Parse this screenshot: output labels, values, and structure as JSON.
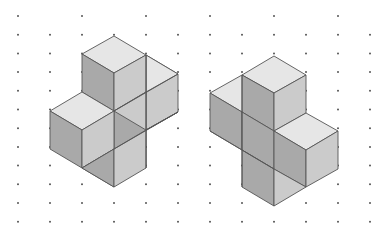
{
  "figure": {
    "colors": {
      "background": "#ffffff",
      "top_face": "#e6e6e6",
      "left_face": "#a9a9a9",
      "right_face": "#cbcbcb",
      "edge": "#555555",
      "dot": "#555555"
    },
    "grid": {
      "dx": 32,
      "dy": 18.7,
      "origin_x": 18,
      "origin_y": 16,
      "cols": 12,
      "rows": 12
    },
    "solids": [
      {
        "name": "left-solid",
        "faces": [
          {
            "type": "right",
            "pts": "146,55 178,74 178,112 146,130"
          },
          {
            "type": "top",
            "pts": "146,55 178,74 146,92 146,55"
          },
          {
            "type": "top",
            "pts": "114,36 146,55 114,73 82,54"
          },
          {
            "type": "left",
            "pts": "82,54 114,73 114,111 82,92"
          },
          {
            "type": "right",
            "pts": "114,73 146,55 146,92 114,111"
          },
          {
            "type": "right",
            "pts": "114,111 146,92 146,130 114,149"
          },
          {
            "type": "left",
            "pts": "114,111 146,130 146,168 114,149"
          },
          {
            "type": "right",
            "pts": "146,130 178,112 146,130"
          },
          {
            "type": "top",
            "pts": "82,92 114,111 82,130 50,111"
          },
          {
            "type": "left",
            "pts": "50,111 82,130 82,168 50,149"
          },
          {
            "type": "right",
            "pts": "82,130 114,111 114,149 82,168"
          },
          {
            "type": "left",
            "pts": "82,168 114,149 114,187 82,168"
          },
          {
            "type": "left",
            "pts": "82,168 114,149 114,187"
          },
          {
            "type": "right",
            "pts": "114,149 146,130 146,168 114,187"
          }
        ],
        "extra_lines": [
          "146,55 146,168",
          "114,111 178,74",
          "114,149 178,112"
        ]
      },
      {
        "name": "right-solid",
        "faces": [
          {
            "type": "top",
            "pts": "242,75 274,93 242,112 210,93"
          },
          {
            "type": "left",
            "pts": "210,93 242,112 242,150 210,131"
          },
          {
            "type": "top",
            "pts": "274,56 306,75 274,93 242,75"
          },
          {
            "type": "left",
            "pts": "242,75 274,93 274,131 242,112"
          },
          {
            "type": "right",
            "pts": "274,93 306,75 306,113 274,131"
          },
          {
            "type": "left",
            "pts": "242,112 274,131 274,169 242,150"
          },
          {
            "type": "top",
            "pts": "306,113 338,131 306,150 274,131"
          },
          {
            "type": "left",
            "pts": "274,131 306,150 306,187 274,169"
          },
          {
            "type": "right",
            "pts": "306,150 338,131 338,169 306,187"
          },
          {
            "type": "left",
            "pts": "242,150 274,169 274,206 242,187"
          },
          {
            "type": "right",
            "pts": "274,169 306,187 274,206"
          }
        ],
        "extra_lines": [
          "210,131 274,169",
          "242,75 242,187"
        ]
      }
    ]
  }
}
